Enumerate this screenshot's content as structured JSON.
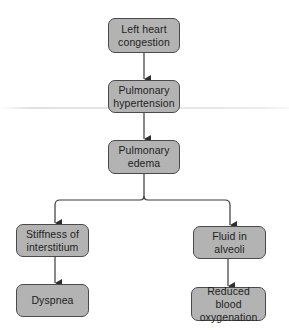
{
  "diagram": {
    "type": "flowchart",
    "colors": {
      "node_fill": "#b3b3b3",
      "node_border": "#4a4a4a",
      "connector": "#3a3a3a",
      "text": "#1e1e1e"
    },
    "nodes": [
      {
        "id": "left-heart-congestion",
        "lines": [
          "Left heart",
          "congestion"
        ]
      },
      {
        "id": "pulmonary-hypertension",
        "lines": [
          "Pulmonary",
          "hypertension"
        ]
      },
      {
        "id": "pulmonary-edema",
        "lines": [
          "Pulmonary",
          "edema"
        ]
      },
      {
        "id": "stiffness-of-interstitium",
        "lines": [
          "Stiffness of",
          "interstitium"
        ]
      },
      {
        "id": "fluid-in-alveoli",
        "lines": [
          "Fluid in",
          "alveoli"
        ]
      },
      {
        "id": "dyspnea",
        "lines": [
          "Dyspnea"
        ]
      },
      {
        "id": "reduced-blood-oxygenation",
        "lines": [
          "Reduced blood",
          "oxygenation"
        ]
      }
    ],
    "edges": [
      {
        "from": "left-heart-congestion",
        "to": "pulmonary-hypertension"
      },
      {
        "from": "pulmonary-hypertension",
        "to": "pulmonary-edema"
      },
      {
        "from": "pulmonary-edema",
        "to": "stiffness-of-interstitium"
      },
      {
        "from": "pulmonary-edema",
        "to": "fluid-in-alveoli"
      },
      {
        "from": "stiffness-of-interstitium",
        "to": "dyspnea"
      },
      {
        "from": "fluid-in-alveoli",
        "to": "reduced-blood-oxygenation"
      }
    ]
  }
}
